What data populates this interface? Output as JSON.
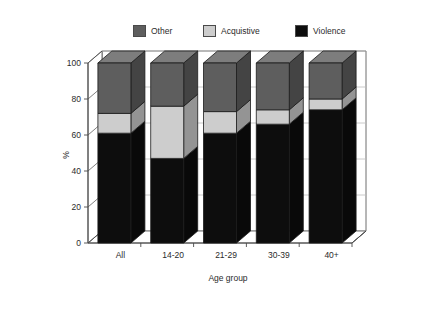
{
  "chart_data": {
    "type": "bar",
    "title": "",
    "subtitle": "",
    "xlabel": "Age group",
    "ylabel": "%",
    "ylim": [
      0,
      100
    ],
    "yticks": [
      0,
      20,
      40,
      60,
      80,
      100
    ],
    "grid": true,
    "stacked": true,
    "legend_position": "top",
    "categories": [
      "All",
      "14-20",
      "21-29",
      "30-39",
      "40+"
    ],
    "series": [
      {
        "name": "Violence",
        "color": "#0d0d0d",
        "values": [
          61,
          47,
          61,
          66,
          74
        ]
      },
      {
        "name": "Acquistive",
        "color": "#cdcdcd",
        "values": [
          11,
          29,
          12,
          8,
          6
        ]
      },
      {
        "name": "Other",
        "color": "#5e5e5e",
        "values": [
          28,
          24,
          27,
          26,
          20
        ]
      }
    ]
  },
  "legend": {
    "items": [
      {
        "label": "Other",
        "swatch": "#5e5e5e"
      },
      {
        "label": "Acquistive",
        "swatch": "#cdcdcd"
      },
      {
        "label": "Violence",
        "swatch": "#0d0d0d"
      }
    ]
  },
  "axes": {
    "y_title": "%",
    "x_title": "Age group",
    "y_tick_labels": [
      "100",
      "80",
      "60",
      "40",
      "20",
      "0"
    ],
    "x_tick_labels": [
      "All",
      "14-20",
      "21-29",
      "30-39",
      "40+"
    ]
  },
  "colors": {
    "violence": "#0d0d0d",
    "acquistive": "#cdcdcd",
    "other": "#5e5e5e",
    "wall": "#ffffff",
    "gridline": "#bdbdbd",
    "axis": "#4a4a4a",
    "border": "#dcdcdc"
  }
}
